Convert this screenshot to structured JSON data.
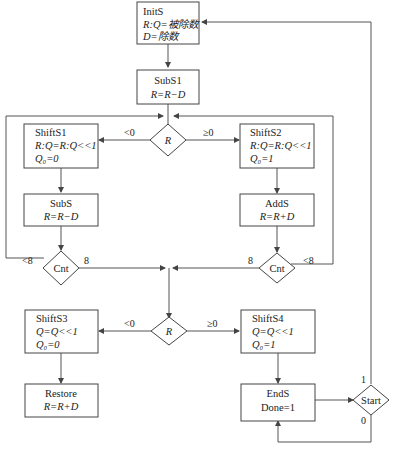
{
  "nodes": {
    "inits": {
      "title": "InitS",
      "line1": "R:Q=被除数",
      "line2": "D=除数"
    },
    "subs1": {
      "title": "SubS1",
      "line1": "R=R−D"
    },
    "decision_r1": {
      "label": "R"
    },
    "shifts1": {
      "title": "ShiftS1",
      "line1": "R:Q=R:Q<<1",
      "line2": "Q₀=0"
    },
    "shifts2": {
      "title": "ShiftS2",
      "line1": "R:Q=R:Q<<1",
      "line2": "Q₀=1"
    },
    "subs": {
      "title": "SubS",
      "line1": "R=R−D"
    },
    "adds": {
      "title": "AddS",
      "line1": "R=R+D"
    },
    "cnt_left": {
      "label": "Cnt"
    },
    "cnt_right": {
      "label": "Cnt"
    },
    "decision_r2": {
      "label": "R"
    },
    "shifts3": {
      "title": "ShiftS3",
      "line1": "Q=Q<<1",
      "line2": "Q₀=0"
    },
    "shifts4": {
      "title": "ShiftS4",
      "line1": "Q=Q<<1",
      "line2": "Q₀=1"
    },
    "restore": {
      "title": "Restore",
      "line1": "R=R+D"
    },
    "ends": {
      "title": "EndS",
      "line1": "Done=1"
    },
    "start": {
      "label": "Start"
    }
  },
  "edge_labels": {
    "r1_neg": "<0",
    "r1_pos": "≥0",
    "cnt_left_loop": "<8",
    "cnt_left_done": "8",
    "cnt_right_done": "8",
    "cnt_right_loop": "<8",
    "r2_neg": "<0",
    "r2_pos": "≥0",
    "start_one": "1",
    "start_zero": "0"
  }
}
